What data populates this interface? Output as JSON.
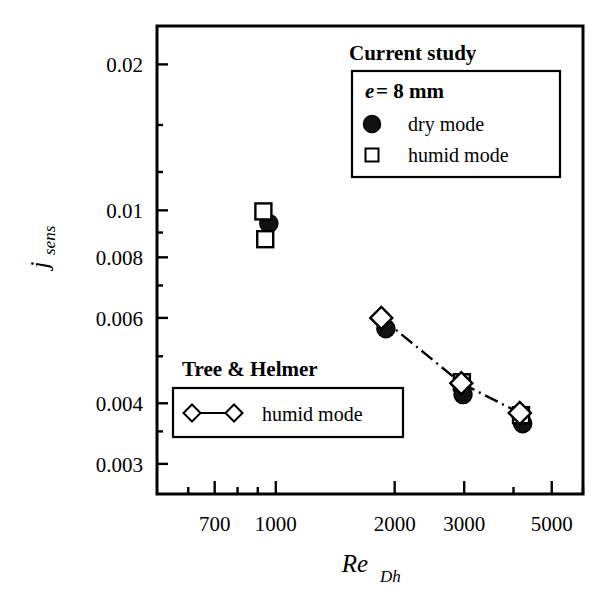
{
  "chart_data": {
    "type": "scatter",
    "title": "",
    "xlabel": "Re_Dh",
    "ylabel": "j_sens",
    "xscale": "log",
    "yscale": "log",
    "xlim": [
      500,
      6000
    ],
    "ylim": [
      0.0026,
      0.024
    ],
    "grid": false,
    "xticks": [
      700,
      1000,
      2000,
      3000,
      5000
    ],
    "xtick_labels": [
      "700",
      "1000",
      "2000",
      "3000",
      "5000"
    ],
    "yticks": [
      0.003,
      0.004,
      0.006,
      0.008,
      0.01,
      0.02
    ],
    "ytick_labels": [
      "0.003",
      "0.004",
      "0.006",
      "0.008",
      "0.01",
      "0.02"
    ],
    "series": [
      {
        "name": "dry mode",
        "group": "Current study",
        "marker": "filled-circle",
        "line": "none",
        "points": [
          {
            "x": 960,
            "y": 0.0094
          },
          {
            "x": 1900,
            "y": 0.0057
          },
          {
            "x": 2980,
            "y": 0.00417
          },
          {
            "x": 4220,
            "y": 0.00363
          }
        ]
      },
      {
        "name": "humid mode",
        "group": "Current study",
        "marker": "open-square",
        "line": "none",
        "points": [
          {
            "x": 930,
            "y": 0.00995
          },
          {
            "x": 940,
            "y": 0.00872
          },
          {
            "x": 2960,
            "y": 0.00442
          },
          {
            "x": 4180,
            "y": 0.00378
          }
        ]
      },
      {
        "name": "humid mode",
        "group": "Tree & Helmer",
        "marker": "open-diamond",
        "line": "dash-dot",
        "points": [
          {
            "x": 1850,
            "y": 0.006
          },
          {
            "x": 2950,
            "y": 0.0044
          },
          {
            "x": 4150,
            "y": 0.00382
          }
        ]
      }
    ]
  },
  "legends": {
    "current_study": {
      "heading": "Current study",
      "title_italic": "e",
      "title_rest": " = 8 mm",
      "items": [
        {
          "marker": "filled-circle",
          "label": "dry mode"
        },
        {
          "marker": "open-square",
          "label": "humid mode"
        }
      ]
    },
    "tree_helmer": {
      "heading": "Tree & Helmer",
      "items": [
        {
          "marker": "diamond-line-diamond",
          "label": "humid mode"
        }
      ]
    }
  },
  "axes": {
    "y_title_main": "j",
    "y_title_sub": "sens",
    "x_title_main": "Re",
    "x_title_sub": "Dh"
  },
  "colors": {
    "axis": "#000000",
    "marker_fill": "#111111",
    "marker_edge": "#000000",
    "background": "#ffffff"
  }
}
